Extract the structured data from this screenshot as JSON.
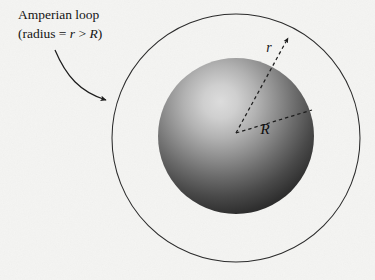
{
  "figure": {
    "title_label": "Amperian loop",
    "subtitle_label": "(radius = r > R)",
    "caption_line1": "Amperian loop",
    "caption_prefix": "(radius = ",
    "caption_var_r": "r",
    "caption_relation": " > ",
    "caption_var_R": "R",
    "caption_suffix": ")",
    "radius_outer_label": "r",
    "radius_inner_label": "R",
    "background_color": "#f4f4f2",
    "line_color": "#1d1d1d",
    "sphere_highlight_color": "#d0d0d0",
    "sphere_mid_color": "#8a8a8a",
    "sphere_dark_color": "#262626",
    "label_color": "#141414",
    "amperian_loop": {
      "center_x": 236,
      "center_y": 138,
      "radius": 124
    },
    "sphere": {
      "center_x": 236,
      "center_y": 136,
      "radius": 78,
      "highlight_x": 205,
      "highlight_y": 92
    },
    "leader_arrow": {
      "start_x": 55,
      "start_y": 50,
      "end_x": 110,
      "end_y": 101
    },
    "outer_radius_line": {
      "start_x": 236,
      "start_y": 133,
      "end_x": 291,
      "end_y": 33
    },
    "inner_radius_line": {
      "start_x": 236,
      "start_y": 133,
      "end_x": 312,
      "end_y": 110
    }
  }
}
